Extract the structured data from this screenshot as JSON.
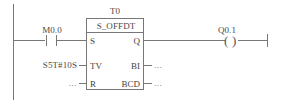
{
  "diagram": {
    "language": "LAD",
    "network_title": "",
    "colors": {
      "line": "#777777",
      "text": "#4a4a4a",
      "background": "#ffffff"
    }
  },
  "rail": {
    "name": "left-power-rail"
  },
  "contact": {
    "operand": "M0.0",
    "type": "normally-open-contact"
  },
  "block": {
    "instance": "T0",
    "type": "S_OFFDT",
    "inputs": [
      {
        "pin": "S",
        "operand": ""
      },
      {
        "pin": "TV",
        "operand": "S5T#10S"
      },
      {
        "pin": "R",
        "operand": "..."
      }
    ],
    "outputs": [
      {
        "pin": "Q",
        "operand": ""
      },
      {
        "pin": "BI",
        "operand": "..."
      },
      {
        "pin": "BCD",
        "operand": "..."
      }
    ]
  },
  "coil": {
    "operand": "Q0.1",
    "type": "output-coil",
    "left_paren": "(",
    "right_paren": ")"
  }
}
